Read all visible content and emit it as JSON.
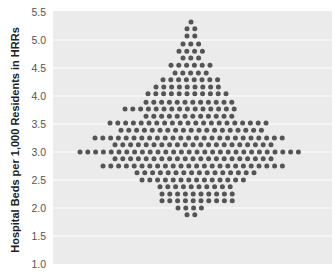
{
  "chart_data": {
    "type": "scatter",
    "subtype": "beeswarm",
    "title": "",
    "xlabel": "",
    "ylabel": "Hospital Beds per 1,000 Residents in HRRs",
    "ylim": [
      1.0,
      5.5
    ],
    "yticks": [
      "1.0",
      "1.5",
      "2.0",
      "2.5",
      "3.0",
      "3.5",
      "4.0",
      "4.5",
      "5.0",
      "5.5"
    ],
    "grid": true,
    "legend": null,
    "colors": {
      "plot_bg": "#ebebeb",
      "grid": "#ffffff",
      "dot": "#555555"
    },
    "rows": [
      {
        "value": 5.32,
        "count": 1,
        "x0": 191
      },
      {
        "value": 5.2,
        "count": 2,
        "x0": 187
      },
      {
        "value": 5.07,
        "count": 2,
        "x0": 187
      },
      {
        "value": 4.93,
        "count": 3,
        "x0": 183
      },
      {
        "value": 4.8,
        "count": 4,
        "x0": 179
      },
      {
        "value": 4.68,
        "count": 3,
        "x0": 183
      },
      {
        "value": 4.55,
        "count": 6,
        "x0": 171
      },
      {
        "value": 4.41,
        "count": 5,
        "x0": 175
      },
      {
        "value": 4.29,
        "count": 8,
        "x0": 163
      },
      {
        "value": 4.16,
        "count": 9,
        "x0": 156
      },
      {
        "value": 4.04,
        "count": 11,
        "x0": 148
      },
      {
        "value": 3.89,
        "count": 12,
        "x0": 146
      },
      {
        "value": 3.77,
        "count": 15,
        "x0": 125
      },
      {
        "value": 3.64,
        "count": 12,
        "x0": 146
      },
      {
        "value": 3.52,
        "count": 21,
        "x0": 110
      },
      {
        "value": 3.39,
        "count": 19,
        "x0": 121
      },
      {
        "value": 3.25,
        "count": 25,
        "x0": 95
      },
      {
        "value": 3.13,
        "count": 21,
        "x0": 115
      },
      {
        "value": 3.0,
        "count": 29,
        "x0": 80
      },
      {
        "value": 2.88,
        "count": 21,
        "x0": 115
      },
      {
        "value": 2.75,
        "count": 24,
        "x0": 103
      },
      {
        "value": 2.63,
        "count": 16,
        "x0": 137
      },
      {
        "value": 2.5,
        "count": 14,
        "x0": 142
      },
      {
        "value": 2.38,
        "count": 10,
        "x0": 160
      },
      {
        "value": 2.25,
        "count": 10,
        "x0": 162
      },
      {
        "value": 2.13,
        "count": 10,
        "x0": 162
      },
      {
        "value": 2.0,
        "count": 4,
        "x0": 178
      },
      {
        "value": 1.88,
        "count": 2,
        "x0": 187
      }
    ]
  }
}
